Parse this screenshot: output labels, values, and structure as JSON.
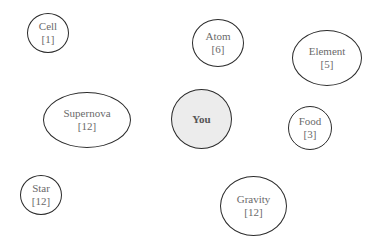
{
  "diagram": {
    "type": "concept-bubble-map",
    "center_node": {
      "label": "You",
      "fill": "#ececec"
    },
    "nodes": [
      {
        "id": "cell",
        "label": "Cell",
        "count": "[1]"
      },
      {
        "id": "atom",
        "label": "Atom",
        "count": "[6]"
      },
      {
        "id": "element",
        "label": "Element",
        "count": "[5]"
      },
      {
        "id": "supernova",
        "label": "Supernova",
        "count": "[12]"
      },
      {
        "id": "food",
        "label": "Food",
        "count": "[3]"
      },
      {
        "id": "star",
        "label": "Star",
        "count": "[12]"
      },
      {
        "id": "gravity",
        "label": "Gravity",
        "count": "[12]"
      }
    ],
    "colors": {
      "stroke": "#2b2b2b",
      "text": "#6a6a6a",
      "center_fill": "#ececec",
      "background": "#ffffff"
    }
  }
}
